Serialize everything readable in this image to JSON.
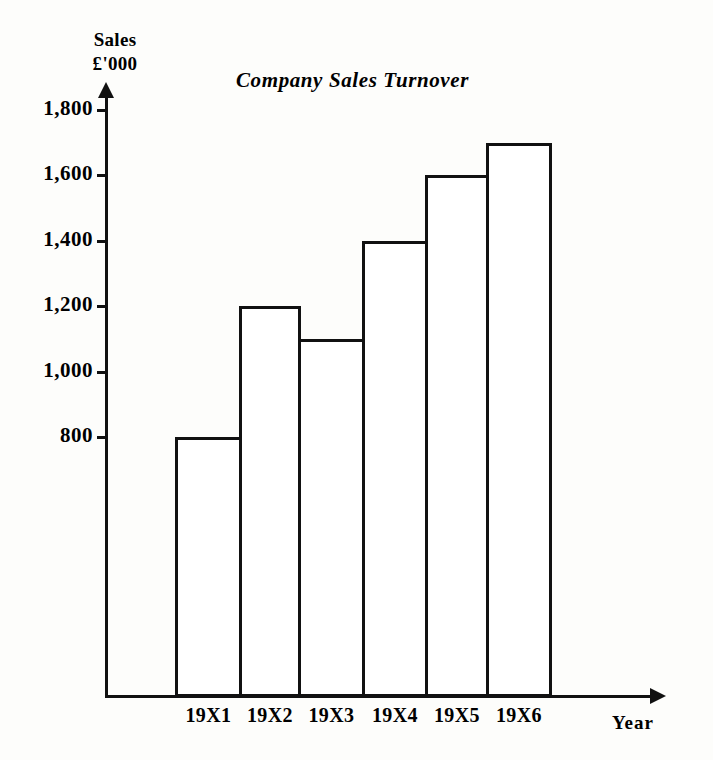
{
  "figure": {
    "background_color": "#fdfdfb",
    "ink_color": "#111111"
  },
  "chart_data": {
    "type": "bar",
    "title": "Company Sales Turnover",
    "xlabel": "Year",
    "ylabel": "Sales £'000",
    "ylabel_lines": [
      "Sales",
      "£'000"
    ],
    "categories": [
      "19X1",
      "19X2",
      "19X3",
      "19X4",
      "19X5",
      "19X6"
    ],
    "values": [
      800,
      1200,
      1100,
      1400,
      1600,
      1700
    ],
    "ylim": [
      0,
      1900
    ],
    "yticks": [
      800,
      1000,
      1200,
      1400,
      1600,
      1800
    ],
    "ytick_labels": [
      "800",
      "1,000",
      "1,200",
      "1,400",
      "1,600",
      "1,800"
    ],
    "grid": false,
    "legend": false,
    "bar_style": "hollow-outline-adjacent",
    "bar_fill": "#ffffff",
    "bar_edge": "#111111"
  }
}
